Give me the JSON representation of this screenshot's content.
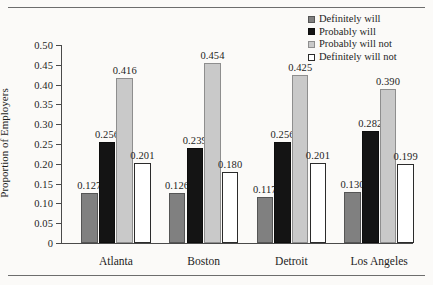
{
  "chart_data": {
    "type": "bar",
    "title": "",
    "subtitle": "",
    "xlabel": "",
    "ylabel": "Proportion of Employers",
    "categories": [
      "Atlanta",
      "Boston",
      "Detroit",
      "Los Angeles"
    ],
    "series": [
      {
        "name": "Definitely will",
        "color": "#808080",
        "values": [
          0.127,
          0.126,
          0.117,
          0.13
        ]
      },
      {
        "name": "Probably will",
        "color": "#141414",
        "values": [
          0.256,
          0.239,
          0.256,
          0.282
        ]
      },
      {
        "name": "Probably will not",
        "color": "#c9c9c9",
        "values": [
          0.416,
          0.454,
          0.425,
          0.39
        ]
      },
      {
        "name": "Definitely will not",
        "color": "#ffffff",
        "values": [
          0.201,
          0.18,
          0.201,
          0.199
        ]
      }
    ],
    "data_labels": [
      [
        "0.127",
        "0.256",
        "0.416",
        "0.201"
      ],
      [
        "0.126",
        "0.239",
        "0.454",
        "0.180"
      ],
      [
        "0.117",
        "0.256",
        "0.425",
        "0.201"
      ],
      [
        "0.130",
        "0.282",
        "0.390",
        "0.199"
      ]
    ],
    "ylim": [
      0,
      0.5
    ],
    "ytick_values": [
      0,
      0.05,
      0.1,
      0.15,
      0.2,
      0.25,
      0.3,
      0.35,
      0.4,
      0.45,
      0.5
    ],
    "ytick_labels": [
      "0",
      "0.05",
      "0.10",
      "0.15",
      "0.20",
      "0.25",
      "0.30",
      "0.35",
      "0.40",
      "0.45",
      "0.50"
    ],
    "grid": false,
    "legend_position": "top-right",
    "legend_entries": [
      "Definitely will",
      "Probably will",
      "Probably will not",
      "Definitely will not"
    ]
  }
}
